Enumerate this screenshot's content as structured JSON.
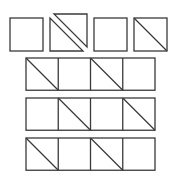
{
  "puzzle": {
    "stroke_color": "#3a3a3a",
    "background": "#ffffff",
    "top_row": {
      "items": [
        {
          "id": "figure-1",
          "type": "square",
          "x": 10,
          "y": 18,
          "size": 33
        },
        {
          "id": "figure-2",
          "type": "split-square",
          "x": 50,
          "y": 18,
          "size": 33,
          "offset_dx": 4,
          "offset_dy": -4
        },
        {
          "id": "figure-3",
          "type": "square",
          "x": 94,
          "y": 18,
          "size": 33
        },
        {
          "id": "figure-4",
          "type": "diagonal-square",
          "x": 134,
          "y": 18,
          "size": 33
        }
      ]
    },
    "grid": {
      "x": 26,
      "cell_size": 32.25,
      "columns": 4,
      "rows": [
        {
          "id": "option-row-1",
          "y": 58,
          "diagonals": [
            1,
            0,
            1,
            0
          ]
        },
        {
          "id": "option-row-2",
          "y": 98,
          "diagonals": [
            0,
            1,
            0,
            1
          ]
        },
        {
          "id": "option-row-3",
          "y": 138,
          "diagonals": [
            1,
            0,
            1,
            0
          ]
        }
      ]
    }
  }
}
